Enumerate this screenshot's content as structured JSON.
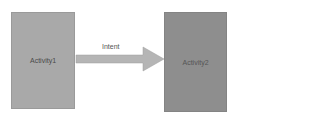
{
  "diagram": {
    "nodes": [
      {
        "id": "activity1",
        "label": "Activity1",
        "color": "#a9a9a9"
      },
      {
        "id": "activity2",
        "label": "Activity2",
        "color": "#8e8e8e"
      }
    ],
    "edges": [
      {
        "from": "activity1",
        "to": "activity2",
        "label": "Intent",
        "color": "#b5b5b5"
      }
    ]
  }
}
